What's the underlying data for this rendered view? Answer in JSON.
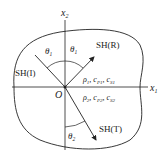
{
  "diagram": {
    "axes": {
      "x1": {
        "label": "x",
        "sub": "1"
      },
      "x2": {
        "label": "x",
        "sub": "2"
      },
      "origin": "O"
    },
    "waves": {
      "incident": {
        "label": "SH(I)"
      },
      "reflected": {
        "label": "SH(R)"
      },
      "transmitted": {
        "label": "SH(T)"
      }
    },
    "angles": {
      "incident": {
        "symbol": "θ",
        "sub": "1"
      },
      "reflected": {
        "symbol": "θ",
        "sub": "1"
      },
      "transmitted": {
        "symbol": "θ",
        "sub": "2"
      }
    },
    "media": {
      "upper": {
        "rho": "ρ",
        "rho_sub": "1",
        "cP": "c",
        "cP_sub": "P1",
        "cS": "c",
        "cS_sub": "S1"
      },
      "lower": {
        "rho": "ρ",
        "rho_sub": "2",
        "cP": "c",
        "cP_sub": "P2",
        "cS": "c",
        "cS_sub": "S2"
      }
    },
    "colors": {
      "line": "#222222",
      "background": "#ffffff"
    }
  }
}
